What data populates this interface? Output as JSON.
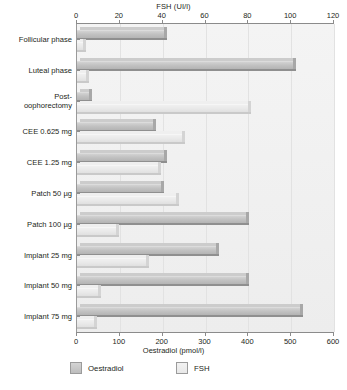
{
  "chart_data": {
    "type": "bar",
    "orientation": "horizontal",
    "grid": true,
    "legend_position": "bottom",
    "categories": [
      "Follicular phase",
      "Luteal phase",
      "Post-\noophorectomy",
      "CEE 0.625 mg",
      "CEE 1.25 mg",
      "Patch 50 µg",
      "Patch 100 µg",
      "Implant 25 mg",
      "Implant 50 mg",
      "Implant 75 mg"
    ],
    "series": [
      {
        "name": "Oestradiol",
        "unit": "pmol/l",
        "axis": "bottom",
        "color": "#c2c2c2",
        "values": [
          203,
          504,
          28,
          177,
          203,
          196,
          395,
          325,
          395,
          520
        ]
      },
      {
        "name": "FSH",
        "unit": "UI/l",
        "axis": "top",
        "color": "#e9e9e9",
        "values": [
          3,
          4,
          80,
          49,
          38,
          46,
          18,
          32,
          10,
          8
        ]
      }
    ],
    "top_axis": {
      "label": "FSH (UI/l)",
      "ticks": [
        0,
        20,
        40,
        60,
        80,
        100,
        120
      ],
      "lim": [
        0,
        120
      ]
    },
    "bottom_axis": {
      "label": "Oestradiol (pmol/l)",
      "ticks": [
        0,
        100,
        200,
        300,
        400,
        500,
        600
      ],
      "lim": [
        0,
        600
      ]
    }
  },
  "legend": [
    {
      "label": "Oestradiol"
    },
    {
      "label": "FSH"
    }
  ]
}
